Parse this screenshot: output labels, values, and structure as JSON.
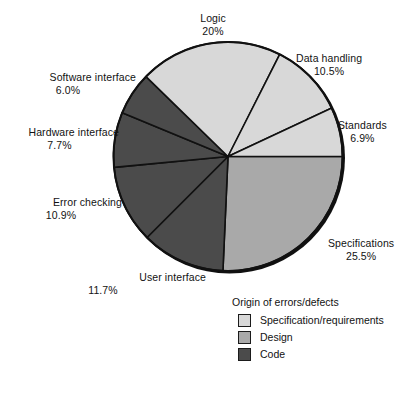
{
  "chart_data": {
    "type": "pie",
    "title": "",
    "legend_title": "Origin of errors/defects",
    "legend_position": "bottom-right",
    "total": 100,
    "units": "%",
    "start_angle_deg": 0,
    "direction": "clockwise",
    "categories": [
      "Specifications",
      "User interface",
      "Error checking",
      "Hardware interface",
      "Software interface",
      "Logic",
      "Data handling",
      "Standards"
    ],
    "values": [
      25.5,
      11.7,
      10.9,
      7.7,
      6.0,
      20.0,
      10.5,
      6.9
    ],
    "labels": [
      "25.5%",
      "11.7%",
      "10.9%",
      "7.7%",
      "6.0%",
      "20%",
      "10.5%",
      "6.9%"
    ],
    "groups": [
      "Design",
      "Code",
      "Code",
      "Code",
      "Code",
      "Specification/requirements",
      "Specification/requirements",
      "Specification/requirements"
    ],
    "slice_colors": [
      "#a9a9a9",
      "#4b4b4b",
      "#4b4b4b",
      "#4b4b4b",
      "#4b4b4b",
      "#d8d8d8",
      "#d8d8d8",
      "#d8d8d8"
    ],
    "series": [
      {
        "name": "Origin of errors/defects",
        "values": [
          25.5,
          11.7,
          10.9,
          7.7,
          6.0,
          20.0,
          10.5,
          6.9
        ]
      }
    ]
  },
  "slices": [
    {
      "name": "Specifications",
      "value_label": "25.5%",
      "color": "#a9a9a9"
    },
    {
      "name": "User interface",
      "value_label": "11.7%",
      "color": "#4b4b4b"
    },
    {
      "name": "Error checking",
      "value_label": "10.9%",
      "color": "#4b4b4b"
    },
    {
      "name": "Hardware interface",
      "value_label": "7.7%",
      "color": "#4b4b4b"
    },
    {
      "name": "Software interface",
      "value_label": "6.0%",
      "color": "#4b4b4b"
    },
    {
      "name": "Logic",
      "value_label": "20%",
      "color": "#d8d8d8"
    },
    {
      "name": "Data handling",
      "value_label": "10.5%",
      "color": "#d8d8d8"
    },
    {
      "name": "Standards",
      "value_label": "6.9%",
      "color": "#d8d8d8"
    }
  ],
  "legend": {
    "title": "Origin of errors/defects",
    "items": [
      {
        "label": "Specification/requirements",
        "color": "#d8d8d8"
      },
      {
        "label": "Design",
        "color": "#a9a9a9"
      },
      {
        "label": "Code",
        "color": "#4b4b4b"
      }
    ]
  },
  "colors": {
    "specification_requirements": "#d8d8d8",
    "design": "#a9a9a9",
    "code": "#4b4b4b",
    "outline": "#111111",
    "background": "#ffffff",
    "text": "#121212"
  }
}
